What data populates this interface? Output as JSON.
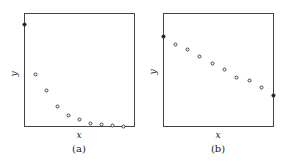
{
  "chart_data": [
    {
      "type": "scatter",
      "panel": "(a)",
      "title": "",
      "xlabel": "x",
      "ylabel": "y",
      "grid": false,
      "ticks": false,
      "frame": {
        "x0": 24,
        "y0": 13,
        "x1": 134,
        "y1": 126
      },
      "points_px": [
        {
          "x": 24,
          "y": 24,
          "filled": true
        },
        {
          "x": 35,
          "y": 74,
          "filled": false
        },
        {
          "x": 46,
          "y": 90,
          "filled": false
        },
        {
          "x": 57,
          "y": 106,
          "filled": false
        },
        {
          "x": 68,
          "y": 115,
          "filled": false
        },
        {
          "x": 79,
          "y": 119,
          "filled": false
        },
        {
          "x": 90,
          "y": 123,
          "filled": false
        },
        {
          "x": 101,
          "y": 124,
          "filled": false
        },
        {
          "x": 112,
          "y": 125,
          "filled": false
        },
        {
          "x": 123,
          "y": 126,
          "filled": false
        }
      ],
      "description": "Rapidly decaying (exponential-like) sequence of points; first point filled"
    },
    {
      "type": "scatter",
      "panel": "(b)",
      "title": "",
      "xlabel": "x",
      "ylabel": "y",
      "grid": false,
      "ticks": false,
      "frame": {
        "x0": 163,
        "y0": 13,
        "x1": 273,
        "y1": 126
      },
      "points_px": [
        {
          "x": 163,
          "y": 36,
          "filled": true
        },
        {
          "x": 175,
          "y": 44,
          "filled": false
        },
        {
          "x": 187,
          "y": 49,
          "filled": false
        },
        {
          "x": 199,
          "y": 56,
          "filled": false
        },
        {
          "x": 212,
          "y": 63,
          "filled": false
        },
        {
          "x": 224,
          "y": 69,
          "filled": false
        },
        {
          "x": 236,
          "y": 77,
          "filled": false
        },
        {
          "x": 249,
          "y": 80,
          "filled": false
        },
        {
          "x": 261,
          "y": 87,
          "filled": false
        },
        {
          "x": 273,
          "y": 95,
          "filled": true
        }
      ],
      "description": "Roughly linear decreasing sequence of points; first and last points filled"
    }
  ],
  "panels": {
    "a": {
      "xlabel": "x",
      "ylabel": "y",
      "caption": "(a)"
    },
    "b": {
      "xlabel": "x",
      "ylabel": "y",
      "caption": "(b)"
    }
  }
}
